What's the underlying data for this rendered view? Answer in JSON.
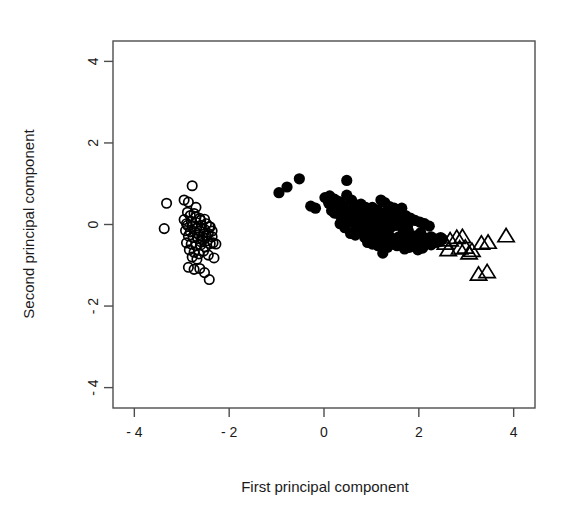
{
  "chart_data": {
    "type": "scatter",
    "title": "",
    "xlabel": "First principal component",
    "ylabel": "Second principal component",
    "xlim": [
      -4.45,
      4.45
    ],
    "ylim": [
      -4.5,
      4.5
    ],
    "xticks": [
      -4,
      -2,
      0,
      2,
      4
    ],
    "yticks": [
      -4,
      -2,
      0,
      2,
      4
    ],
    "xtick_labels": [
      "- 4",
      "- 2",
      "0",
      "2",
      "4"
    ],
    "ytick_labels": [
      "- 4",
      "- 2",
      "0",
      "2",
      "4"
    ],
    "grid": false,
    "legend": "none",
    "box": true,
    "colors": {
      "foreground": "#000000",
      "background": "#ffffff",
      "axis": "#4d4d4d"
    },
    "series": [
      {
        "name": "group-1",
        "marker": "open-circle",
        "marker_size": 5.6,
        "fill": "none",
        "stroke": "#000000",
        "points": [
          [
            -2.78,
            0.95
          ],
          [
            -3.32,
            0.52
          ],
          [
            -2.95,
            0.6
          ],
          [
            -2.86,
            0.55
          ],
          [
            -3.37,
            -0.1
          ],
          [
            -2.7,
            0.42
          ],
          [
            -2.88,
            0.3
          ],
          [
            -2.82,
            0.22
          ],
          [
            -2.74,
            0.27
          ],
          [
            -2.62,
            0.15
          ],
          [
            -2.95,
            0.12
          ],
          [
            -2.8,
            0.08
          ],
          [
            -2.7,
            0.05
          ],
          [
            -2.6,
            0.1
          ],
          [
            -2.52,
            0.13
          ],
          [
            -2.88,
            -0.02
          ],
          [
            -2.78,
            -0.05
          ],
          [
            -2.68,
            -0.08
          ],
          [
            -2.58,
            -0.02
          ],
          [
            -2.48,
            0.02
          ],
          [
            -2.4,
            -0.06
          ],
          [
            -2.92,
            -0.15
          ],
          [
            -2.82,
            -0.18
          ],
          [
            -2.72,
            -0.2
          ],
          [
            -2.62,
            -0.16
          ],
          [
            -2.52,
            -0.12
          ],
          [
            -2.44,
            -0.22
          ],
          [
            -2.36,
            -0.3
          ],
          [
            -2.86,
            -0.28
          ],
          [
            -2.76,
            -0.32
          ],
          [
            -2.66,
            -0.35
          ],
          [
            -2.56,
            -0.3
          ],
          [
            -2.46,
            -0.4
          ],
          [
            -2.34,
            -0.45
          ],
          [
            -2.9,
            -0.45
          ],
          [
            -2.8,
            -0.48
          ],
          [
            -2.7,
            -0.52
          ],
          [
            -2.6,
            -0.5
          ],
          [
            -2.5,
            -0.55
          ],
          [
            -2.4,
            -0.47
          ],
          [
            -2.28,
            -0.48
          ],
          [
            -2.84,
            -0.62
          ],
          [
            -2.74,
            -0.68
          ],
          [
            -2.64,
            -0.72
          ],
          [
            -2.54,
            -0.65
          ],
          [
            -2.44,
            -0.75
          ],
          [
            -2.32,
            -0.82
          ],
          [
            -2.78,
            -0.8
          ],
          [
            -2.68,
            -0.85
          ],
          [
            -2.86,
            -1.05
          ],
          [
            -2.74,
            -1.1
          ],
          [
            -2.62,
            -1.08
          ],
          [
            -2.52,
            -1.18
          ],
          [
            -2.42,
            -1.35
          ],
          [
            -2.64,
            -0.25
          ],
          [
            -2.56,
            -0.38
          ],
          [
            -2.7,
            0.18
          ],
          [
            -2.6,
            -0.42
          ],
          [
            -2.48,
            -0.28
          ],
          [
            -2.9,
            0.02
          ],
          [
            -2.42,
            -0.05
          ],
          [
            -2.36,
            -0.16
          ]
        ]
      },
      {
        "name": "group-2",
        "marker": "filled-circle",
        "marker_size": 5.6,
        "fill": "#000000",
        "stroke": "#000000",
        "points": [
          [
            -0.95,
            0.78
          ],
          [
            -0.78,
            0.92
          ],
          [
            -0.52,
            1.12
          ],
          [
            0.48,
            1.08
          ],
          [
            -0.28,
            0.45
          ],
          [
            -0.18,
            0.4
          ],
          [
            0.02,
            0.66
          ],
          [
            0.12,
            0.7
          ],
          [
            0.22,
            0.62
          ],
          [
            0.32,
            0.56
          ],
          [
            0.1,
            0.52
          ],
          [
            0.2,
            0.46
          ],
          [
            0.3,
            0.42
          ],
          [
            0.4,
            0.48
          ],
          [
            0.48,
            0.72
          ],
          [
            0.58,
            0.6
          ],
          [
            0.4,
            0.36
          ],
          [
            0.5,
            0.32
          ],
          [
            0.6,
            0.38
          ],
          [
            0.68,
            0.44
          ],
          [
            0.78,
            0.5
          ],
          [
            0.88,
            0.42
          ],
          [
            0.22,
            0.28
          ],
          [
            0.34,
            0.22
          ],
          [
            0.46,
            0.18
          ],
          [
            0.58,
            0.24
          ],
          [
            0.68,
            0.16
          ],
          [
            0.78,
            0.2
          ],
          [
            0.88,
            0.12
          ],
          [
            0.98,
            0.18
          ],
          [
            1.08,
            0.24
          ],
          [
            1.18,
            0.16
          ],
          [
            0.52,
            0.06
          ],
          [
            0.64,
            0.02
          ],
          [
            0.76,
            0.05
          ],
          [
            0.86,
            -0.02
          ],
          [
            0.96,
            0.0
          ],
          [
            1.06,
            0.06
          ],
          [
            1.16,
            -0.05
          ],
          [
            1.26,
            0.02
          ],
          [
            1.36,
            0.1
          ],
          [
            1.46,
            0.16
          ],
          [
            0.7,
            -0.12
          ],
          [
            0.82,
            -0.16
          ],
          [
            0.92,
            -0.2
          ],
          [
            1.02,
            -0.14
          ],
          [
            1.12,
            -0.18
          ],
          [
            1.22,
            -0.24
          ],
          [
            1.32,
            -0.12
          ],
          [
            1.42,
            -0.06
          ],
          [
            1.52,
            -0.02
          ],
          [
            1.62,
            0.06
          ],
          [
            0.86,
            -0.32
          ],
          [
            0.98,
            -0.36
          ],
          [
            1.08,
            -0.3
          ],
          [
            1.18,
            -0.38
          ],
          [
            1.28,
            -0.34
          ],
          [
            1.38,
            -0.28
          ],
          [
            1.48,
            -0.36
          ],
          [
            1.58,
            -0.3
          ],
          [
            1.68,
            -0.22
          ],
          [
            1.78,
            -0.16
          ],
          [
            1.24,
            -0.7
          ],
          [
            1.14,
            -0.52
          ],
          [
            1.34,
            -0.56
          ],
          [
            1.44,
            -0.48
          ],
          [
            1.54,
            -0.52
          ],
          [
            1.64,
            -0.44
          ],
          [
            1.74,
            -0.4
          ],
          [
            1.84,
            -0.34
          ],
          [
            1.94,
            -0.28
          ],
          [
            2.04,
            -0.2
          ],
          [
            1.28,
            0.54
          ],
          [
            1.38,
            0.44
          ],
          [
            1.48,
            0.4
          ],
          [
            1.2,
            0.6
          ],
          [
            1.02,
            0.42
          ],
          [
            1.12,
            0.36
          ],
          [
            1.3,
            0.3
          ],
          [
            1.4,
            0.26
          ],
          [
            1.52,
            0.32
          ],
          [
            1.62,
            0.28
          ],
          [
            1.72,
            0.22
          ],
          [
            1.82,
            0.16
          ],
          [
            1.92,
            0.1
          ],
          [
            2.02,
            0.06
          ],
          [
            2.12,
            0.02
          ],
          [
            2.22,
            -0.04
          ],
          [
            1.86,
            -0.52
          ],
          [
            1.96,
            -0.46
          ],
          [
            2.06,
            -0.4
          ],
          [
            2.16,
            -0.34
          ],
          [
            2.26,
            -0.3
          ],
          [
            2.36,
            -0.36
          ],
          [
            2.46,
            -0.32
          ],
          [
            2.16,
            -0.46
          ],
          [
            2.26,
            -0.5
          ],
          [
            2.36,
            -0.44
          ],
          [
            1.7,
            -0.6
          ],
          [
            1.8,
            -0.56
          ],
          [
            0.62,
            0.52
          ],
          [
            0.74,
            0.3
          ],
          [
            0.94,
            0.32
          ],
          [
            1.06,
            -0.42
          ],
          [
            1.44,
            0.06
          ],
          [
            1.56,
            0.12
          ],
          [
            1.66,
            -0.1
          ],
          [
            1.76,
            -0.04
          ],
          [
            2.08,
            -0.58
          ],
          [
            1.98,
            -0.62
          ],
          [
            0.44,
            -0.08
          ],
          [
            0.56,
            -0.22
          ],
          [
            0.66,
            -0.26
          ],
          [
            0.92,
            -0.44
          ],
          [
            1.02,
            -0.48
          ],
          [
            2.44,
            -0.42
          ],
          [
            2.5,
            -0.36
          ],
          [
            0.34,
            0.02
          ],
          [
            0.16,
            0.34
          ],
          [
            1.64,
            0.4
          ]
        ]
      },
      {
        "name": "group-3",
        "marker": "open-triangle",
        "marker_size": 6.5,
        "fill": "none",
        "stroke": "#000000",
        "points": [
          [
            2.56,
            -0.46
          ],
          [
            2.66,
            -0.38
          ],
          [
            2.8,
            -0.32
          ],
          [
            2.92,
            -0.3
          ],
          [
            2.62,
            -0.62
          ],
          [
            2.86,
            -0.58
          ],
          [
            2.98,
            -0.56
          ],
          [
            3.12,
            -0.64
          ],
          [
            3.06,
            -0.7
          ],
          [
            3.32,
            -0.46
          ],
          [
            3.46,
            -0.44
          ],
          [
            3.84,
            -0.28
          ],
          [
            3.26,
            -1.22
          ],
          [
            3.44,
            -1.16
          ]
        ]
      }
    ]
  },
  "plot": {
    "x_axis_label": "First principal component",
    "y_axis_label": "Second principal component"
  }
}
